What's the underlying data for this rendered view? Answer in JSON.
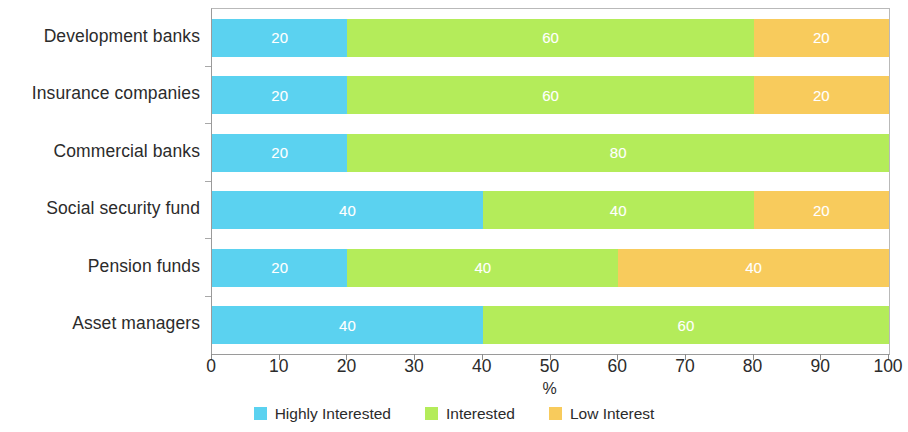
{
  "chart_data": {
    "type": "bar",
    "orientation": "horizontal",
    "stacked": true,
    "stack_mode": "percent",
    "title": "",
    "subtitle": "",
    "xlabel": "%",
    "ylabel": "",
    "xlim": [
      0,
      100
    ],
    "xticks": [
      0,
      10,
      20,
      30,
      40,
      50,
      60,
      70,
      80,
      90,
      100
    ],
    "xtick_labels": [
      "0",
      "10",
      "20",
      "30",
      "40",
      "50",
      "60",
      "70",
      "80",
      "90",
      "100"
    ],
    "grid": false,
    "legend_position": "bottom",
    "categories": [
      "Development banks",
      "Insurance companies",
      "Commercial banks",
      "Social security fund",
      "Pension funds",
      "Asset managers"
    ],
    "series": [
      {
        "name": "Highly Interested",
        "color": "#5BD2F0",
        "values": [
          20,
          20,
          20,
          40,
          20,
          40
        ]
      },
      {
        "name": "Interested",
        "color": "#B4EC5A",
        "values": [
          60,
          60,
          80,
          40,
          40,
          60
        ]
      },
      {
        "name": "Low Interest",
        "color": "#F8CB5C",
        "values": [
          20,
          20,
          0,
          20,
          40,
          0
        ]
      }
    ],
    "bar_labels": [
      [
        "20",
        "60",
        "20"
      ],
      [
        "20",
        "60",
        "20"
      ],
      [
        "20",
        "80",
        ""
      ],
      [
        "40",
        "40",
        "20"
      ],
      [
        "20",
        "40",
        "40"
      ],
      [
        "40",
        "60",
        ""
      ]
    ]
  },
  "axis": {
    "x_title": "%",
    "tick_labels": [
      "0",
      "10",
      "20",
      "30",
      "40",
      "50",
      "60",
      "70",
      "80",
      "90",
      "100"
    ]
  },
  "legend": {
    "items": [
      {
        "label": "Highly Interested",
        "color": "#5BD2F0"
      },
      {
        "label": "Interested",
        "color": "#B4EC5A"
      },
      {
        "label": "Low Interest",
        "color": "#F8CB5C"
      }
    ]
  },
  "categories": [
    "Development banks",
    "Insurance companies",
    "Commercial banks",
    "Social security fund",
    "Pension funds",
    "Asset managers"
  ]
}
